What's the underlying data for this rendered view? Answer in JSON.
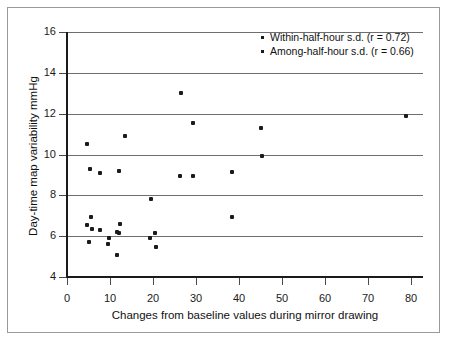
{
  "chart_data": {
    "type": "scatter",
    "title": "",
    "xlabel": "Changes from baseline values during mirror drawing",
    "ylabel": "Day-time map variability mmHg",
    "xlim": [
      0,
      85
    ],
    "ylim": [
      4,
      16
    ],
    "xticks": [
      0,
      10,
      20,
      30,
      40,
      50,
      60,
      70,
      80
    ],
    "yticks": [
      4,
      6,
      8,
      10,
      12,
      14,
      16
    ],
    "grid": "horizontal",
    "legend_position": "top-right",
    "series": [
      {
        "name": "Within-half-hour s.d. (r = 0.72)",
        "points": [
          [
            4.6,
            10.5
          ],
          [
            5.4,
            9.3
          ],
          [
            7.6,
            9.1
          ],
          [
            13.4,
            10.9
          ],
          [
            12.0,
            9.2
          ],
          [
            26.4,
            13.0
          ],
          [
            29.3,
            11.55
          ],
          [
            26.3,
            8.95
          ],
          [
            29.4,
            8.95
          ],
          [
            38.4,
            9.15
          ],
          [
            45.2,
            11.3
          ],
          [
            45.3,
            9.95
          ],
          [
            78.8,
            11.9
          ]
        ]
      },
      {
        "name": "Among-half-hour s.d. (r = 0.66)",
        "points": [
          [
            5.6,
            6.95
          ],
          [
            4.6,
            6.55
          ],
          [
            5.7,
            6.35
          ],
          [
            7.6,
            6.3
          ],
          [
            5.2,
            5.7
          ],
          [
            9.7,
            5.9
          ],
          [
            9.6,
            5.6
          ],
          [
            11.6,
            5.1
          ],
          [
            12.4,
            6.6
          ],
          [
            11.7,
            6.2
          ],
          [
            12.2,
            6.15
          ],
          [
            19.5,
            7.8
          ],
          [
            20.4,
            6.15
          ],
          [
            19.4,
            5.9
          ],
          [
            20.6,
            5.45
          ],
          [
            38.3,
            6.95
          ]
        ]
      }
    ],
    "legend": [
      {
        "label": "Within-half-hour s.d. (r = 0.72)"
      },
      {
        "label": "Among-half-hour s.d. (r = 0.66)"
      }
    ]
  },
  "colors": {
    "marker": "#1b1b1b",
    "gridline": "#6e6e6e",
    "axis": "#1a1a1a",
    "border": "#9a9a9a",
    "background": "#ffffff"
  }
}
